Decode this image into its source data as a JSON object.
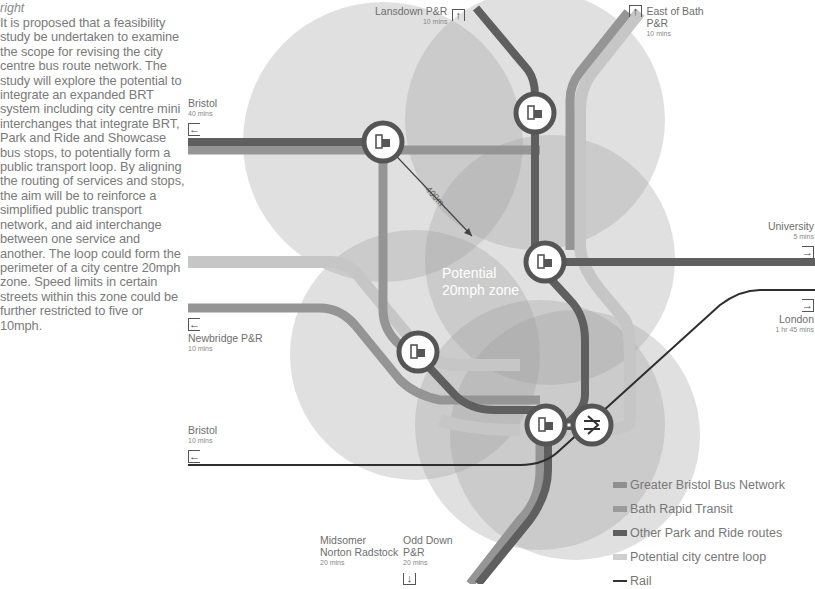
{
  "sidebar": {
    "caption": "right",
    "body": "It is proposed that a feasibility study be undertaken to examine the scope for revising the city centre bus route network. The study will explore the potential to integrate an expanded BRT system including city centre mini interchanges that integrate BRT, Park and Ride and Showcase bus stops, to potentially form a public transport loop. By aligning the routing of services and stops, the aim will be to reinforce a simplified public transport network, and aid interchange between one service and another. The loop could form the perimeter of a city centre 20mph zone. Speed limits in certain streets within this zone could be further restricted to five or 10mph."
  },
  "map": {
    "zone_label_line1": "Potential",
    "zone_label_line2": "20mph zone",
    "radius_label": "400m",
    "destinations": [
      {
        "name": "Lansdown P&R",
        "time": "10 mins",
        "arrow": "up"
      },
      {
        "name": "East of Bath P&R",
        "time": "10 mins",
        "arrow": "up"
      },
      {
        "name": "Bristol",
        "time": "40 mins",
        "arrow": "left"
      },
      {
        "name": "University",
        "time": "5 mins",
        "arrow": "right"
      },
      {
        "name": "London",
        "time": "1 hr 45 mins",
        "arrow": "right"
      },
      {
        "name": "Newbridge P&R",
        "time": "10 mins",
        "arrow": "left"
      },
      {
        "name": "Bristol",
        "time": "10 mins",
        "arrow": "left"
      },
      {
        "name": "Midsomer Norton Radstock",
        "time": "20 mins",
        "arrow": "none"
      },
      {
        "name": "Odd Down P&R",
        "time": "20 mins",
        "arrow": "down"
      }
    ],
    "stops": [
      {
        "type": "bus-interchange",
        "icon": "bus-stop-icon"
      },
      {
        "type": "bus-interchange",
        "icon": "bus-stop-icon"
      },
      {
        "type": "bus-interchange",
        "icon": "bus-stop-icon"
      },
      {
        "type": "bus-interchange",
        "icon": "bus-stop-icon"
      },
      {
        "type": "bus-interchange",
        "icon": "bus-stop-icon"
      },
      {
        "type": "rail-station",
        "icon": "national-rail-icon"
      }
    ]
  },
  "legend": {
    "items": [
      {
        "label": "Greater Bristol Bus Network",
        "color": "#8f8f8f"
      },
      {
        "label": "Bath Rapid Transit",
        "color": "#9a9a9a"
      },
      {
        "label": "Other Park and Ride routes",
        "color": "#5e5e5e"
      },
      {
        "label": "Potential city centre loop",
        "color": "#cfcfcf"
      },
      {
        "label": "Rail",
        "color": "#333333"
      }
    ]
  },
  "colors": {
    "circle_fill": "#9c9c9c",
    "route_dark": "#5e5e5e",
    "route_mid": "#8f8f8f",
    "loop": "#c8c8c8",
    "rail": "#333333"
  }
}
